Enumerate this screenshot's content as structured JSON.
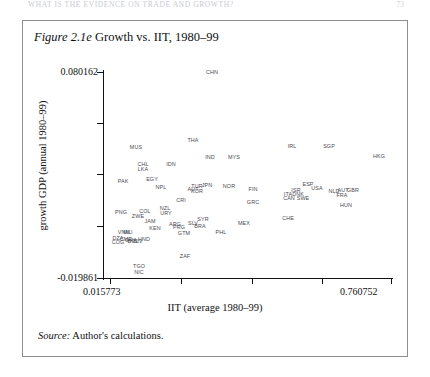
{
  "running_head": {
    "text": "WHAT IS THE EVIDENCE ON TRADE AND GROWTH?",
    "folio": "73"
  },
  "figure": {
    "number": "Figure 2.1e",
    "title": "Growth vs. IIT, 1980–99",
    "source_label": "Source:",
    "source_text": "Author's calculations."
  },
  "chart_data": {
    "type": "scatter",
    "title": "Figure 2.1e Growth vs. IIT, 1980–99",
    "xlabel": "IIT (average 1980–99)",
    "ylabel": "growth GDP (annual 1980–99)",
    "xlim": [
      0.015773,
      0.760752
    ],
    "ylim": [
      -0.019861,
      0.080162
    ],
    "xtick_labels": [
      "0.015773",
      "0.760752"
    ],
    "ytick_labels": [
      "0.080162",
      "-0.019861"
    ],
    "grid": false,
    "legend": "none",
    "point_label_style": "country-iso3-codes",
    "points": [
      {
        "label": "CHN",
        "x": 0.384,
        "y": 0.0793
      },
      {
        "label": "THA",
        "x": 0.333,
        "y": 0.0467
      },
      {
        "label": "MUS",
        "x": 0.186,
        "y": 0.0434
      },
      {
        "label": "IRL",
        "x": 0.618,
        "y": 0.0437
      },
      {
        "label": "SGP",
        "x": 0.706,
        "y": 0.0437
      },
      {
        "label": "HKG",
        "x": 0.773,
        "y": 0.0393
      },
      {
        "label": "IND",
        "x": 0.298,
        "y": 0.0383
      },
      {
        "label": "MYS",
        "x": 0.36,
        "y": 0.0383
      },
      {
        "label": "CHL",
        "x": 0.158,
        "y": 0.0373
      },
      {
        "label": "LKA",
        "x": 0.158,
        "y": 0.0354
      },
      {
        "label": "IDN",
        "x": 0.236,
        "y": 0.0373
      },
      {
        "label": "PAK",
        "x": 0.106,
        "y": 0.032
      },
      {
        "label": "EGY",
        "x": 0.18,
        "y": 0.0325
      },
      {
        "label": "NPL",
        "x": 0.192,
        "y": 0.0301
      },
      {
        "label": "NOR",
        "x": 0.396,
        "y": 0.0306
      },
      {
        "label": "FIN",
        "x": 0.45,
        "y": 0.0291
      },
      {
        "label": "TUR",
        "x": 0.32,
        "y": 0.0301
      },
      {
        "label": "JPN",
        "x": 0.344,
        "y": 0.0306
      },
      {
        "label": "AUT",
        "x": 0.311,
        "y": 0.0291
      },
      {
        "label": "KOR",
        "x": 0.317,
        "y": 0.0286
      },
      {
        "label": "ESP",
        "x": 0.601,
        "y": 0.0301
      },
      {
        "label": "USA",
        "x": 0.625,
        "y": 0.0291
      },
      {
        "label": "GBR",
        "x": 0.7,
        "y": 0.0286
      },
      {
        "label": "NLD",
        "x": 0.659,
        "y": 0.0281
      },
      {
        "label": "AUT2",
        "x": 0.675,
        "y": 0.0281
      },
      {
        "label": "FRA",
        "x": 0.672,
        "y": 0.0267
      },
      {
        "label": "ISR",
        "x": 0.572,
        "y": 0.0277
      },
      {
        "label": "ITA",
        "x": 0.554,
        "y": 0.0267
      },
      {
        "label": "DNK",
        "x": 0.575,
        "y": 0.0267
      },
      {
        "label": "CAN",
        "x": 0.554,
        "y": 0.0257
      },
      {
        "label": "SWE",
        "x": 0.587,
        "y": 0.0257
      },
      {
        "label": "HUN",
        "x": 0.69,
        "y": 0.0233
      },
      {
        "label": "CRI",
        "x": 0.254,
        "y": 0.0248
      },
      {
        "label": "GRC",
        "x": 0.45,
        "y": 0.0243
      },
      {
        "label": "CHE",
        "x": 0.56,
        "y": 0.0199
      },
      {
        "label": "COL",
        "x": 0.171,
        "y": 0.0228
      },
      {
        "label": "NZL",
        "x": 0.212,
        "y": 0.0233
      },
      {
        "label": "URY",
        "x": 0.215,
        "y": 0.0218
      },
      {
        "label": "PNG",
        "x": 0.102,
        "y": 0.0218
      },
      {
        "label": "ZWE",
        "x": 0.14,
        "y": 0.0209
      },
      {
        "label": "JAM",
        "x": 0.162,
        "y": 0.0194
      },
      {
        "label": "SYR",
        "x": 0.345,
        "y": 0.0194
      },
      {
        "label": "MEX",
        "x": 0.432,
        "y": 0.0184
      },
      {
        "label": "SLV",
        "x": 0.32,
        "y": 0.0184
      },
      {
        "label": "BRA",
        "x": 0.336,
        "y": 0.0174
      },
      {
        "label": "ARG",
        "x": 0.278,
        "y": 0.0179
      },
      {
        "label": "PRG",
        "x": 0.286,
        "y": 0.0169
      },
      {
        "label": "KEN",
        "x": 0.183,
        "y": 0.0164
      },
      {
        "label": "GTM",
        "x": 0.296,
        "y": 0.0155
      },
      {
        "label": "PHL",
        "x": 0.38,
        "y": 0.016
      },
      {
        "label": "VNM",
        "x": 0.108,
        "y": 0.015
      },
      {
        "label": "MLI",
        "x": 0.112,
        "y": 0.015
      },
      {
        "label": "DZA",
        "x": 0.1,
        "y": 0.0136
      },
      {
        "label": "COG",
        "x": 0.1,
        "y": 0.0126
      },
      {
        "label": "CMR",
        "x": 0.118,
        "y": 0.0136
      },
      {
        "label": "GHA",
        "x": 0.125,
        "y": 0.0131
      },
      {
        "label": "HND",
        "x": 0.148,
        "y": 0.0136
      },
      {
        "label": "BOL",
        "x": 0.13,
        "y": 0.0126
      },
      {
        "label": "CIV",
        "x": 0.14,
        "y": 0.0126
      },
      {
        "label": "ZAF",
        "x": 0.3,
        "y": 0.0073
      },
      {
        "label": "TGO",
        "x": 0.14,
        "y": 0.0039
      },
      {
        "label": "NIC",
        "x": 0.14,
        "y": 0.0015
      }
    ]
  },
  "plot_labels": [
    {
      "text": "CHN",
      "left": 212,
      "top": 72
    },
    {
      "text": "THA",
      "left": 193,
      "top": 140
    },
    {
      "text": "MUS",
      "left": 136,
      "top": 147
    },
    {
      "text": "IRL",
      "left": 292,
      "top": 146
    },
    {
      "text": "SGP",
      "left": 329,
      "top": 146
    },
    {
      "text": "HKG",
      "left": 379,
      "top": 156
    },
    {
      "text": "IND",
      "left": 210,
      "top": 157
    },
    {
      "text": "MYS",
      "left": 234,
      "top": 157
    },
    {
      "text": "CHL",
      "left": 143,
      "top": 164
    },
    {
      "text": "LKA",
      "left": 143,
      "top": 169
    },
    {
      "text": "IDN",
      "left": 171,
      "top": 164
    },
    {
      "text": "PAK",
      "left": 123,
      "top": 181
    },
    {
      "text": "EGY",
      "left": 152,
      "top": 179
    },
    {
      "text": "NPL",
      "left": 161,
      "top": 187
    },
    {
      "text": "NOR",
      "left": 229,
      "top": 186
    },
    {
      "text": "FIN",
      "left": 253,
      "top": 189
    },
    {
      "text": "TUR",
      "left": 197,
      "top": 186
    },
    {
      "text": "JPN",
      "left": 207,
      "top": 185
    },
    {
      "text": "AUT",
      "left": 193,
      "top": 189
    },
    {
      "text": "KOR",
      "left": 197,
      "top": 191
    },
    {
      "text": "ESP",
      "left": 308,
      "top": 184
    },
    {
      "text": "USA",
      "left": 317,
      "top": 188
    },
    {
      "text": "GBR",
      "left": 353,
      "top": 190
    },
    {
      "text": "NLD",
      "left": 334,
      "top": 191
    },
    {
      "text": "AUT",
      "left": 343,
      "top": 190
    },
    {
      "text": "FRA",
      "left": 342,
      "top": 195
    },
    {
      "text": "ISR",
      "left": 296,
      "top": 190
    },
    {
      "text": "ITA",
      "left": 288,
      "top": 194
    },
    {
      "text": "DNK",
      "left": 298,
      "top": 194
    },
    {
      "text": "CAN",
      "left": 289,
      "top": 198
    },
    {
      "text": "SWE",
      "left": 303,
      "top": 198
    },
    {
      "text": "HUN",
      "left": 346,
      "top": 205
    },
    {
      "text": "CRI",
      "left": 181,
      "top": 200
    },
    {
      "text": "GRC",
      "left": 253,
      "top": 202
    },
    {
      "text": "CHE",
      "left": 288,
      "top": 218
    },
    {
      "text": "COL",
      "left": 145,
      "top": 211
    },
    {
      "text": "NZL",
      "left": 165,
      "top": 208
    },
    {
      "text": "URY",
      "left": 166,
      "top": 213
    },
    {
      "text": "PNG",
      "left": 121,
      "top": 212
    },
    {
      "text": "ZWE",
      "left": 138,
      "top": 216
    },
    {
      "text": "JAM",
      "left": 150,
      "top": 221
    },
    {
      "text": "SYR",
      "left": 203,
      "top": 219
    },
    {
      "text": "MEX",
      "left": 244,
      "top": 223
    },
    {
      "text": "SLV",
      "left": 193,
      "top": 223
    },
    {
      "text": "BRA",
      "left": 200,
      "top": 226
    },
    {
      "text": "ARG",
      "left": 175,
      "top": 224
    },
    {
      "text": "PRG",
      "left": 179,
      "top": 227
    },
    {
      "text": "KEN",
      "left": 155,
      "top": 228
    },
    {
      "text": "GTM",
      "left": 184,
      "top": 233
    },
    {
      "text": "PHL",
      "left": 221,
      "top": 232
    },
    {
      "text": "VNM",
      "left": 124,
      "top": 232
    },
    {
      "text": "MLI",
      "left": 128,
      "top": 232
    },
    {
      "text": "DZA",
      "left": 118,
      "top": 238
    },
    {
      "text": "COG",
      "left": 118,
      "top": 242
    },
    {
      "text": "CMR",
      "left": 126,
      "top": 239
    },
    {
      "text": "GHA",
      "left": 131,
      "top": 240
    },
    {
      "text": "HND",
      "left": 144,
      "top": 239
    },
    {
      "text": "BOL",
      "left": 133,
      "top": 241
    },
    {
      "text": "CIV",
      "left": 138,
      "top": 241
    },
    {
      "text": "ZAF",
      "left": 185,
      "top": 256
    },
    {
      "text": "TGO",
      "left": 139,
      "top": 266
    },
    {
      "text": "NIC",
      "left": 139,
      "top": 272
    }
  ],
  "ticks": {
    "y_positions": [
      72,
      123,
      174,
      226,
      278
    ],
    "x_positions": [
      110,
      181,
      252,
      322,
      391
    ]
  }
}
